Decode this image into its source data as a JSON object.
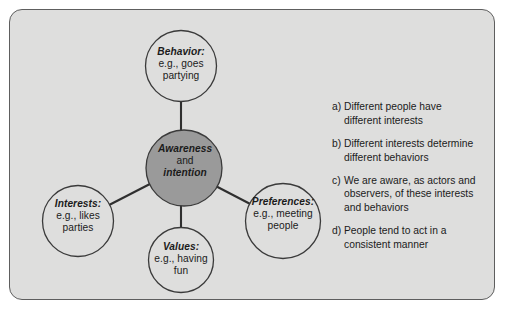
{
  "figure": {
    "panel_fill": "#dededd",
    "panel_border": "#5e5e5e",
    "center_node_fill": "#9a9a9a",
    "outer_node_fill": "#dededd",
    "node_stroke": "#3a3a3a",
    "connector_color": "#2f2f2f"
  },
  "nodes": {
    "center": {
      "name": "awareness-and-intention",
      "line1": "Awareness",
      "line2": "and",
      "line3": "intention"
    },
    "behavior": {
      "name": "behavior",
      "term": "Behavior:",
      "line2": "e.g., goes",
      "line3": "partying"
    },
    "interests": {
      "name": "interests",
      "term": "Interests:",
      "line2": "e.g., likes",
      "line3": "parties"
    },
    "values": {
      "name": "values",
      "term": "Values:",
      "line2": "e.g., having",
      "line3": "fun"
    },
    "preferences": {
      "name": "preferences",
      "term": "Preferences:",
      "line2": "e.g., meeting",
      "line3": "people"
    }
  },
  "propositions": [
    {
      "marker": "a)",
      "line1": "Different people have",
      "line2": "different interests"
    },
    {
      "marker": "b)",
      "line1": "Different interests determine",
      "line2": "different behaviors"
    },
    {
      "marker": "c)",
      "line1": "We are aware, as actors and",
      "line2": "observers, of these interests",
      "line3": "and behaviors"
    },
    {
      "marker": "d)",
      "line1": "People tend to act in a",
      "line2": "consistent manner"
    }
  ]
}
